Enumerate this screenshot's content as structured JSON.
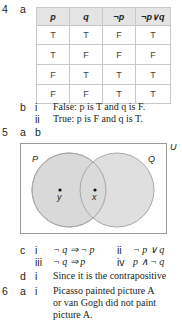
{
  "q4": {
    "number": "4",
    "part_a": "a",
    "table": {
      "headers": [
        "p",
        "q",
        "¬p",
        "¬p∨q"
      ],
      "rows": [
        [
          "T",
          "T",
          "F",
          "T"
        ],
        [
          "T",
          "F",
          "F",
          "F"
        ],
        [
          "F",
          "T",
          "T",
          "T"
        ],
        [
          "F",
          "F",
          "T",
          "T"
        ]
      ]
    },
    "part_b": "b",
    "b_i_label": "i",
    "b_i_text": "False: p is T and q is F.",
    "b_ii_label": "ii",
    "b_ii_text": "True: p is F and q is T."
  },
  "q5": {
    "number": "5",
    "part_a": "a",
    "part_b": "b",
    "venn": {
      "universe_label": "U",
      "set_left": "P",
      "set_right": "Q",
      "point_left_only": "y",
      "point_intersection": "x",
      "fill_color": "#d9d9d9",
      "stroke_color": "#a0a0a0"
    },
    "part_c": "c",
    "c_i_label": "i",
    "c_i_text": "¬ q ⇒ ¬ p",
    "c_ii_label": "ii",
    "c_ii_text": "¬ p ∨ q",
    "c_iii_label": "iii",
    "c_iii_text": "¬ q ⇒ p",
    "c_iv_label": "iv",
    "c_iv_text": "p ∧ ¬ q",
    "part_d": "d",
    "d_i_label": "i",
    "d_i_text": "Since it is the contrapositive"
  },
  "q6": {
    "number": "6",
    "part_a": "a",
    "a_i_label": "i",
    "a_i_line1": "Picasso painted picture A",
    "a_i_line2": "or van Gogh did not paint",
    "a_i_line3": "picture A."
  }
}
